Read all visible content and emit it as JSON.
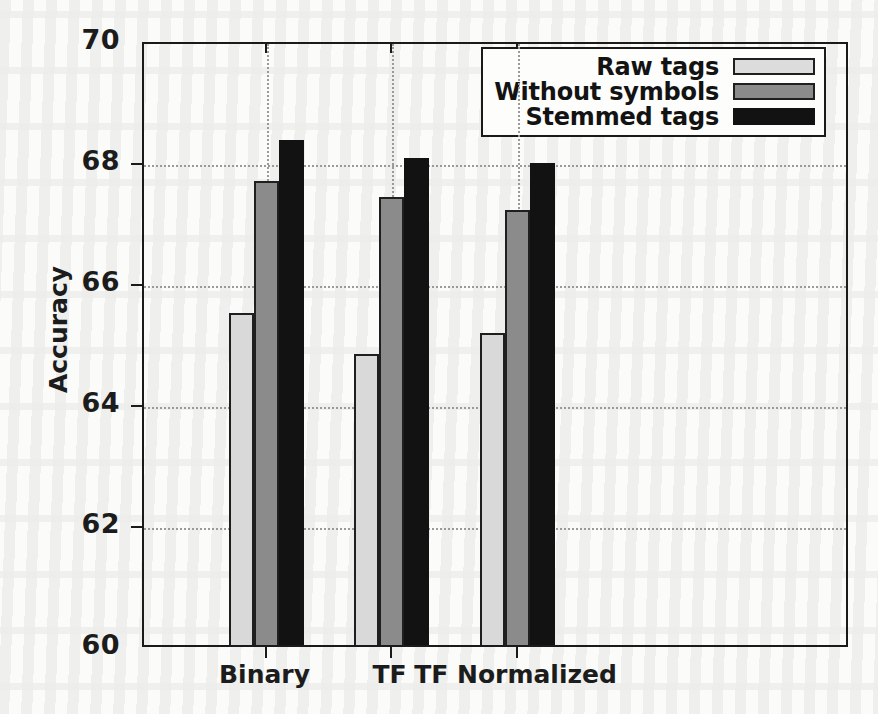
{
  "chart_data": {
    "type": "bar",
    "title": "",
    "xlabel": "",
    "ylabel": "Accuracy",
    "categories": [
      "Binary",
      "TF",
      "TF Normalized"
    ],
    "series": [
      {
        "name": "Raw tags",
        "values": [
          65.55,
          64.88,
          65.22
        ],
        "color": "#d9d9d9"
      },
      {
        "name": "Without symbols",
        "values": [
          67.74,
          67.47,
          67.26
        ],
        "color": "#8b8b8b"
      },
      {
        "name": "Stemmed tags",
        "values": [
          68.42,
          68.12,
          68.04
        ],
        "color": "#121212"
      }
    ],
    "ylim": [
      60,
      70
    ],
    "yticks": [
      70,
      68,
      66,
      64,
      62,
      60
    ],
    "ytick_labels": [
      "70",
      "68",
      "66",
      "64",
      "62",
      "60"
    ],
    "grid": true,
    "grid_style": "dotted",
    "legend_position": "upper right",
    "legend_entries": [
      "Raw tags",
      "Without symbols",
      "Stemmed tags"
    ]
  },
  "axes": {
    "y_axis_title": "Accuracy",
    "x_axis_title": ""
  }
}
